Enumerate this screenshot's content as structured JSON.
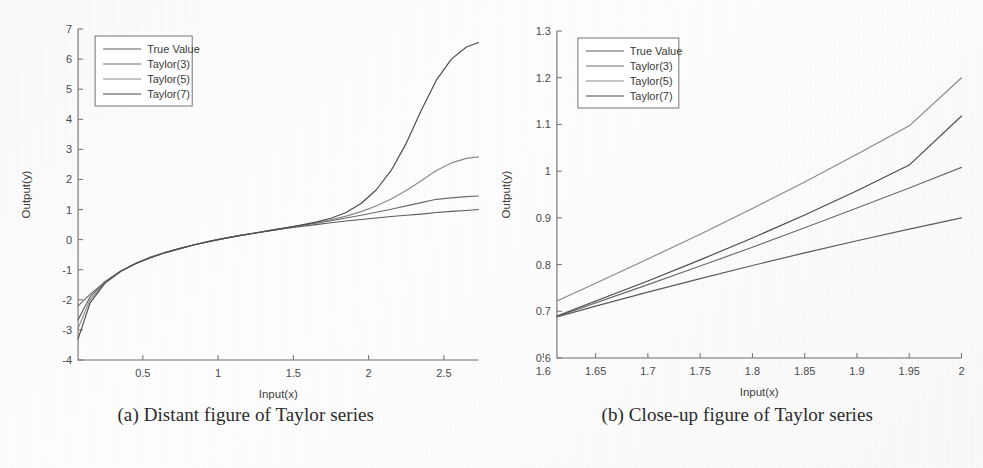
{
  "figure": {
    "subfigures": [
      {
        "id": "a",
        "caption": "(a) Distant figure of Taylor series"
      },
      {
        "id": "b",
        "caption": "(b) Close-up figure of Taylor series"
      }
    ]
  },
  "chart_data": [
    {
      "type": "line",
      "id": "distant",
      "title": "",
      "xlabel": "Input(x)",
      "ylabel": "Output(y)",
      "xlim": [
        0.07,
        2.73
      ],
      "ylim": [
        -4,
        7
      ],
      "xticks": [
        "0.5",
        "1",
        "1.5",
        "2",
        "2.5"
      ],
      "xtick_values": [
        0.5,
        1,
        1.5,
        2,
        2.5
      ],
      "yticks": [
        "-4",
        "-3",
        "-2",
        "-1",
        "0",
        "1",
        "2",
        "3",
        "4",
        "5",
        "6",
        "7"
      ],
      "ytick_values": [
        -4,
        -3,
        -2,
        -1,
        0,
        1,
        2,
        3,
        4,
        5,
        6,
        7
      ],
      "grid": false,
      "legend_position": "upper-left",
      "legend": [
        "True Value",
        "Taylor(3)",
        "Taylor(5)",
        "Taylor(7)"
      ],
      "x": [
        0.07,
        0.15,
        0.25,
        0.35,
        0.45,
        0.55,
        0.65,
        0.75,
        0.85,
        0.95,
        1.05,
        1.15,
        1.25,
        1.35,
        1.45,
        1.55,
        1.65,
        1.75,
        1.85,
        1.95,
        2.05,
        2.15,
        2.25,
        2.35,
        2.45,
        2.55,
        2.65,
        2.73
      ],
      "series": [
        {
          "name": "True Value",
          "values": [
            -2.66,
            -1.9,
            -1.39,
            -1.05,
            -0.8,
            -0.6,
            -0.43,
            -0.29,
            -0.16,
            -0.05,
            0.05,
            0.14,
            0.22,
            0.3,
            0.37,
            0.44,
            0.5,
            0.56,
            0.62,
            0.67,
            0.72,
            0.77,
            0.81,
            0.85,
            0.9,
            0.94,
            0.97,
            1.0
          ]
        },
        {
          "name": "Taylor(3)",
          "values": [
            -2.2,
            -1.82,
            -1.4,
            -1.06,
            -0.79,
            -0.58,
            -0.42,
            -0.29,
            -0.16,
            -0.05,
            0.05,
            0.14,
            0.23,
            0.31,
            0.39,
            0.47,
            0.55,
            0.63,
            0.72,
            0.81,
            0.91,
            1.01,
            1.12,
            1.23,
            1.34,
            1.39,
            1.43,
            1.45
          ]
        },
        {
          "name": "Taylor(5)",
          "values": [
            -2.95,
            -2.0,
            -1.42,
            -1.06,
            -0.8,
            -0.6,
            -0.43,
            -0.29,
            -0.16,
            -0.05,
            0.05,
            0.14,
            0.22,
            0.31,
            0.39,
            0.47,
            0.56,
            0.66,
            0.78,
            0.93,
            1.12,
            1.35,
            1.63,
            1.96,
            2.3,
            2.55,
            2.7,
            2.75
          ]
        },
        {
          "name": "Taylor(7)",
          "values": [
            -3.3,
            -2.1,
            -1.44,
            -1.07,
            -0.8,
            -0.6,
            -0.43,
            -0.29,
            -0.16,
            -0.05,
            0.05,
            0.14,
            0.22,
            0.31,
            0.39,
            0.48,
            0.58,
            0.71,
            0.9,
            1.2,
            1.65,
            2.3,
            3.2,
            4.3,
            5.3,
            6.0,
            6.4,
            6.55
          ]
        }
      ]
    },
    {
      "type": "line",
      "id": "closeup",
      "title": "",
      "xlabel": "Input(x)",
      "ylabel": "Output(y)",
      "xlim": [
        1.613,
        2.0
      ],
      "ylim": [
        0.6,
        1.3
      ],
      "xticks": [
        "1.6",
        "1.65",
        "1.7",
        "1.75",
        "1.8",
        "1.85",
        "1.9",
        "1.95",
        "2"
      ],
      "xtick_values": [
        1.6,
        1.65,
        1.7,
        1.75,
        1.8,
        1.85,
        1.9,
        1.95,
        2.0
      ],
      "yticks": [
        "0.6",
        "0.7",
        "0.8",
        "0.9",
        "1",
        "1.1",
        "1.2",
        "1.3"
      ],
      "ytick_values": [
        0.6,
        0.7,
        0.8,
        0.9,
        1.0,
        1.1,
        1.2,
        1.3
      ],
      "grid": false,
      "legend_position": "upper-left",
      "legend": [
        "True Value",
        "Taylor(3)",
        "Taylor(5)",
        "Taylor(7)"
      ],
      "x": [
        1.613,
        1.65,
        1.7,
        1.75,
        1.8,
        1.85,
        1.9,
        1.95,
        2.0
      ],
      "series": [
        {
          "name": "True Value",
          "values": [
            0.688,
            0.711,
            0.741,
            0.77,
            0.798,
            0.825,
            0.851,
            0.876,
            0.9
          ]
        },
        {
          "name": "Taylor(3)",
          "values": [
            0.689,
            0.718,
            0.757,
            0.797,
            0.837,
            0.879,
            0.921,
            0.964,
            1.008
          ]
        },
        {
          "name": "Taylor(5)",
          "values": [
            0.722,
            0.76,
            0.812,
            0.865,
            0.92,
            0.977,
            1.036,
            1.097,
            1.2
          ]
        },
        {
          "name": "Taylor(7)",
          "values": [
            0.69,
            0.722,
            0.765,
            0.81,
            0.857,
            0.906,
            0.958,
            1.013,
            1.118
          ]
        }
      ]
    }
  ],
  "style": {
    "line_colors": [
      "#5a5a5a",
      "#6b6b6b",
      "#888888",
      "#4a4a4a"
    ],
    "axis_color": "#6e6e6e",
    "text_color": "#3d3d3d",
    "background": "#fdfdfd"
  }
}
